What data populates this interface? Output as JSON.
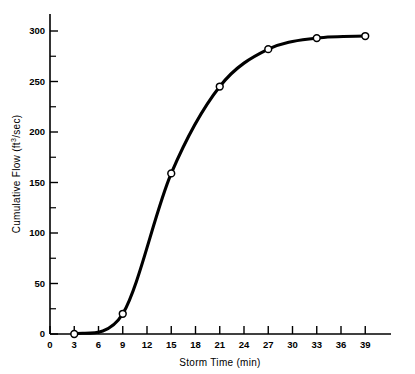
{
  "chart_data": {
    "type": "line",
    "title": "",
    "xlabel": "Storm Time (min)",
    "ylabel": "Cumulative Flow (ft3/sec)",
    "ylabel_parts": {
      "pre": "Cumulative Flow (ft",
      "sup": "3",
      "post": "/sec)"
    },
    "x": [
      3,
      9,
      15,
      21,
      27,
      33,
      39
    ],
    "values": [
      0,
      20,
      159,
      245,
      282,
      293,
      295
    ],
    "xlim": [
      0,
      41
    ],
    "ylim": [
      0,
      315
    ],
    "xticks": [
      0,
      3,
      6,
      9,
      12,
      15,
      18,
      21,
      24,
      27,
      30,
      33,
      36,
      39
    ],
    "xticklabels": [
      "0",
      "3",
      "6",
      "9",
      "12",
      "15",
      "18",
      "21",
      "24",
      "27",
      "30",
      "33",
      "36",
      "39"
    ],
    "yticks": [
      0,
      50,
      100,
      150,
      200,
      250,
      300
    ],
    "yticklabels": [
      "0",
      "50",
      "100",
      "150",
      "200",
      "250",
      "300"
    ],
    "yminorticks": [
      25,
      75,
      125,
      175,
      225,
      275
    ],
    "grid": false,
    "legend": null,
    "marker": "open-circle",
    "line_color": "#000000",
    "marker_fill": "#ffffff",
    "background": "#ffffff"
  }
}
